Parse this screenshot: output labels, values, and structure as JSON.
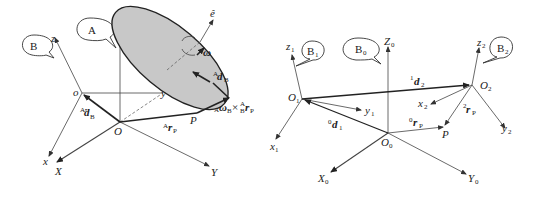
{
  "left_diagram": {
    "bubbles": {
      "A": "A",
      "B": "B"
    },
    "axes_fixed": {
      "Z": "Z",
      "X": "X",
      "Y": "Y",
      "origin": "O"
    },
    "axes_body": {
      "z": "z",
      "x": "x",
      "y": "y",
      "origin": "o"
    },
    "axis_e": "ê",
    "omega": "ω",
    "vec_d_B": {
      "pre": "A",
      "main": "d",
      "sub": "B"
    },
    "vec_d_dot_B": {
      "pre": "A",
      "main": "ḋ",
      "sub": "B"
    },
    "vec_r_P": {
      "pre": "A",
      "main": "r",
      "sub": "P"
    },
    "point_P": "P",
    "cross_term": {
      "pre": "A",
      "omega": "ω",
      "sub1": "B",
      "times": "×",
      "sup2": "A",
      "sub2": "B",
      "r": "r",
      "subP": "P"
    },
    "ellipse_fill": "#c8c8c8"
  },
  "right_diagram": {
    "bubbles": {
      "B0": "B",
      "B0_sub": "0",
      "B1": "B",
      "B1_sub": "1",
      "B2": "B",
      "B2_sub": "2"
    },
    "frame0": {
      "Z": "Z",
      "X": "X",
      "Y": "Y",
      "sub": "0",
      "origin": "O",
      "origin_sub": "0"
    },
    "frame1": {
      "z": "z",
      "x": "x",
      "y": "y",
      "sub": "1",
      "origin": "O",
      "origin_sub": "1"
    },
    "frame2": {
      "z": "z",
      "x": "x",
      "y": "y",
      "sub": "2",
      "origin": "O",
      "origin_sub": "2"
    },
    "vec_d1": {
      "pre": "0",
      "main": "d",
      "sub": "1"
    },
    "vec_d2": {
      "pre": "1",
      "main": "d",
      "sub": "2"
    },
    "vec_0rP": {
      "pre": "0",
      "main": "r",
      "sub": "P"
    },
    "vec_2rP": {
      "pre": "2",
      "main": "r",
      "sub": "P"
    },
    "point_P": "P"
  }
}
